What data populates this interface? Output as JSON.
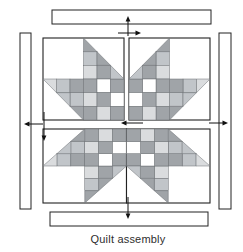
{
  "caption": "Quilt assembly",
  "palette": {
    "D": "#a0a4a8",
    "M": "#c1c5c9",
    "L": "#dadcde",
    "W": "#ffffff"
  },
  "line_colors": {
    "outline": "#222222",
    "grid": "#6a6e72",
    "arrow": "#111111",
    "background": "#ffffff"
  },
  "diagram": {
    "width": 243,
    "height": 252,
    "strips": [
      {
        "name": "top-border-strip",
        "x": 52,
        "y": 10,
        "w": 159,
        "h": 14
      },
      {
        "name": "left-border-strip",
        "x": 20,
        "y": 33,
        "w": 11,
        "h": 176
      },
      {
        "name": "right-border-strip",
        "x": 219,
        "y": 33,
        "w": 12,
        "h": 176
      },
      {
        "name": "bottom-border-strip",
        "x": 50,
        "y": 212,
        "w": 158,
        "h": 14
      }
    ],
    "blocks": [
      {
        "name": "block-top-left",
        "x": 43,
        "y": 38,
        "w": 81,
        "h": 82,
        "orient": "br"
      },
      {
        "name": "block-top-right",
        "x": 129,
        "y": 38,
        "w": 81,
        "h": 82,
        "orient": "bl"
      },
      {
        "name": "block-bottom-left",
        "x": 43,
        "y": 129,
        "w": 83.5,
        "h": 74,
        "orient": "tr"
      },
      {
        "name": "block-bottom-right",
        "x": 126.5,
        "y": 129,
        "w": 83.5,
        "h": 74,
        "orient": "tl"
      }
    ],
    "canonical_block": {
      "grid": 6,
      "squares": [
        {
          "x": 3,
          "y": 1,
          "c": "M"
        },
        {
          "x": 3,
          "y": 2,
          "c": "L"
        },
        {
          "x": 4,
          "y": 2,
          "c": "D"
        },
        {
          "x": 1,
          "y": 3,
          "c": "M"
        },
        {
          "x": 2,
          "y": 3,
          "c": "D"
        },
        {
          "x": 2,
          "y": 4,
          "c": "M"
        },
        {
          "x": 3,
          "y": 3,
          "c": "D"
        },
        {
          "x": 4,
          "y": 3,
          "c": "W"
        },
        {
          "x": 5,
          "y": 3,
          "c": "D"
        },
        {
          "x": 3,
          "y": 4,
          "c": "L"
        },
        {
          "x": 4,
          "y": 4,
          "c": "D"
        },
        {
          "x": 5,
          "y": 4,
          "c": "W"
        },
        {
          "x": 3,
          "y": 5,
          "c": "D"
        },
        {
          "x": 4,
          "y": 5,
          "c": "L"
        },
        {
          "x": 5,
          "y": 5,
          "c": "D"
        }
      ],
      "triangles": [
        {
          "pts": [
            [
              3,
              0
            ],
            [
              3,
              1
            ],
            [
              4,
              1
            ]
          ],
          "c": "D"
        },
        {
          "pts": [
            [
              4,
              1
            ],
            [
              4,
              2
            ],
            [
              5,
              2
            ]
          ],
          "c": "D"
        },
        {
          "pts": [
            [
              5,
              2
            ],
            [
              5,
              3
            ],
            [
              6,
              3
            ]
          ],
          "c": "M"
        },
        {
          "pts": [
            [
              0,
              3
            ],
            [
              1,
              3
            ],
            [
              1,
              4
            ]
          ],
          "c": "L"
        },
        {
          "pts": [
            [
              1,
              4
            ],
            [
              2,
              4
            ],
            [
              2,
              5
            ]
          ],
          "c": "M"
        },
        {
          "pts": [
            [
              2,
              5
            ],
            [
              3,
              5
            ],
            [
              3,
              6
            ]
          ],
          "c": "D"
        }
      ]
    },
    "arrows": [
      {
        "name": "attach-top-border-arrow",
        "x1": 128,
        "y1": 36,
        "x2": 128,
        "y2": 16
      },
      {
        "name": "top-row-seam-arrow",
        "x1": 118,
        "y1": 33,
        "x2": 141,
        "y2": 33
      },
      {
        "name": "join-rows-arrow",
        "x1": 44,
        "y1": 112,
        "x2": 44,
        "y2": 141
      },
      {
        "name": "bottom-row-seam-arrow",
        "x1": 143,
        "y1": 123,
        "x2": 121,
        "y2": 123
      },
      {
        "name": "attach-left-border-arrow",
        "x1": 43,
        "y1": 124,
        "x2": 24,
        "y2": 124
      },
      {
        "name": "attach-right-border-arrow",
        "x1": 209,
        "y1": 123,
        "x2": 228,
        "y2": 123
      },
      {
        "name": "attach-bottom-border-arrow",
        "x1": 128,
        "y1": 197,
        "x2": 128,
        "y2": 219
      }
    ]
  }
}
